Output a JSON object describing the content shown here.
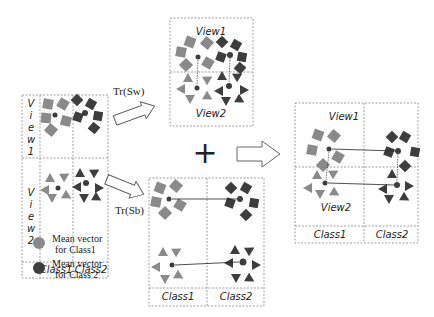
{
  "left_panel": {
    "row_labels": [
      "V i e w 1",
      "V i e w 2"
    ],
    "view1_chars": [
      "V",
      "i",
      "e",
      "w",
      "1"
    ],
    "view2_chars": [
      "V",
      "i",
      "e",
      "w",
      "2"
    ],
    "col_labels": [
      "Class1",
      "Class2"
    ]
  },
  "transforms": {
    "top": "Tr(Sₓₓ)",
    "top_label": "Tr(Sw)",
    "bottom_label": "Tr(Sb)"
  },
  "top_panel": {
    "view1": "View1",
    "view2": "View2"
  },
  "bottom_panel": {
    "col_labels": [
      "Class1",
      "Class2"
    ]
  },
  "right_panel": {
    "view1": "View1",
    "view2": "View2",
    "col_labels": [
      "Class1",
      "Class2"
    ]
  },
  "operator": "+",
  "legend": [
    {
      "label_line1": "Mean vector",
      "label_line2": "for Class1",
      "color": "#8a8a8a"
    },
    {
      "label_line1": "Mean vector",
      "label_line2": "for Class 2",
      "color": "#3d3d3d"
    }
  ],
  "colors": {
    "class1": "#8a8a8a",
    "class2": "#3d3d3d"
  }
}
